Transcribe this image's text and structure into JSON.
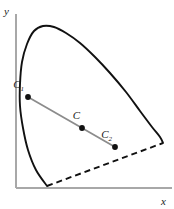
{
  "figure": {
    "type": "chromaticity-diagram",
    "axes": {
      "x_label": "x",
      "y_label": "y"
    },
    "points": [
      {
        "id": "c1",
        "label": "C",
        "subscript": "1"
      },
      {
        "id": "c",
        "label": "C",
        "subscript": ""
      },
      {
        "id": "c2",
        "label": "C",
        "subscript": "2"
      }
    ]
  },
  "chart_data": {
    "type": "line",
    "title": "",
    "xlabel": "x",
    "ylabel": "y",
    "grid": false,
    "legend": null,
    "xlim": [
      0,
      174
    ],
    "ylim": [
      0,
      209
    ],
    "series": [
      {
        "name": "spectral-locus",
        "style": "solid",
        "color": "#111111",
        "points": [
          [
            47,
            186
          ],
          [
            36,
            170
          ],
          [
            28,
            150
          ],
          [
            23,
            128
          ],
          [
            20,
            106
          ],
          [
            20,
            84
          ],
          [
            22,
            62
          ],
          [
            27,
            44
          ],
          [
            34,
            31
          ],
          [
            43,
            26
          ],
          [
            54,
            27
          ],
          [
            66,
            33
          ],
          [
            80,
            43
          ],
          [
            95,
            57
          ],
          [
            110,
            73
          ],
          [
            126,
            92
          ],
          [
            140,
            111
          ],
          [
            152,
            127
          ],
          [
            160,
            137
          ],
          [
            163,
            143
          ]
        ]
      },
      {
        "name": "purple-line",
        "style": "dashed",
        "color": "#111111",
        "points": [
          [
            47,
            186
          ],
          [
            163,
            143
          ]
        ]
      },
      {
        "name": "mixture-line",
        "style": "solid",
        "color": "#8c8c8c",
        "points": [
          [
            28,
            97
          ],
          [
            82,
            128
          ],
          [
            115,
            147
          ]
        ]
      }
    ],
    "markers": [
      {
        "name": "C1",
        "x": 28,
        "y": 97,
        "label": "C",
        "subscript": "1",
        "label_x": 24,
        "label_y": 88
      },
      {
        "name": "C",
        "x": 82,
        "y": 128,
        "label": "C",
        "subscript": "",
        "label_x": 78,
        "label_y": 119
      },
      {
        "name": "C2",
        "x": 115,
        "y": 147,
        "label": "C",
        "subscript": "2",
        "label_x": 111,
        "label_y": 138
      }
    ],
    "axis_lines": {
      "origin": [
        16,
        188
      ],
      "x_end": [
        172,
        188
      ],
      "y_top": [
        16,
        14
      ],
      "color": "#a8a8a8"
    },
    "axis_label_positions": {
      "x": [
        164,
        204
      ],
      "y": [
        5,
        14
      ]
    }
  }
}
